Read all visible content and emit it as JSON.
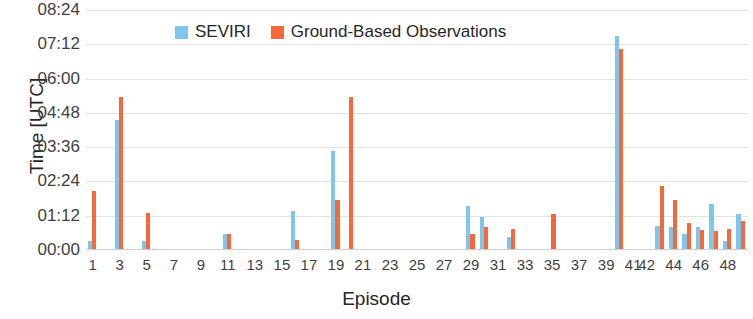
{
  "chart_data": {
    "type": "bar",
    "title": "",
    "xlabel": "Episode",
    "ylabel": "Time [UTC]",
    "grid": true,
    "legend_position": "top-center",
    "ylim": [
      0,
      8.4
    ],
    "y_tick_labels": [
      "00:00",
      "01:12",
      "02:24",
      "03:36",
      "04:48",
      "06:00",
      "07:12",
      "08:24"
    ],
    "y_tick_values": [
      0,
      1.2,
      2.4,
      3.6,
      4.8,
      6.0,
      7.2,
      8.4
    ],
    "x_tick_labels": [
      "1",
      "3",
      "5",
      "7",
      "9",
      "11",
      "13",
      "15",
      "17",
      "19",
      "21",
      "23",
      "25",
      "27",
      "29",
      "31",
      "33",
      "35",
      "37",
      "39",
      "41",
      "42",
      "44",
      "46",
      "48"
    ],
    "x_tick_indices": [
      0,
      2,
      4,
      6,
      8,
      10,
      12,
      14,
      16,
      18,
      20,
      22,
      24,
      26,
      28,
      30,
      32,
      34,
      36,
      38,
      40,
      41,
      43,
      45,
      47
    ],
    "categories": [
      "1",
      "2",
      "3",
      "4",
      "5",
      "6",
      "7",
      "8",
      "9",
      "10",
      "11",
      "12",
      "13",
      "14",
      "15",
      "16",
      "17",
      "18",
      "19",
      "20",
      "21",
      "22",
      "23",
      "24",
      "25",
      "26",
      "27",
      "28",
      "29",
      "30",
      "31",
      "32",
      "33",
      "34",
      "35",
      "36",
      "37",
      "38",
      "39",
      "40",
      "41",
      "42",
      "43",
      "44",
      "45",
      "46",
      "47",
      "48",
      "49"
    ],
    "series": [
      {
        "name": "SEVIRI",
        "color": "#7FC6EA",
        "values": [
          0.3,
          0,
          4.55,
          0,
          0.3,
          0,
          0,
          0,
          0,
          0,
          0.55,
          0,
          0,
          0,
          0,
          1.35,
          0,
          0,
          3.45,
          0,
          0,
          0,
          0,
          0,
          0,
          0,
          0,
          0,
          1.55,
          1.15,
          0,
          0.45,
          0,
          0,
          0,
          0,
          0,
          0,
          0,
          7.5,
          0,
          0,
          0.85,
          0.8,
          0.55,
          0.8,
          1.6,
          0.3,
          1.25
        ]
      },
      {
        "name": "Ground-Based Observations",
        "color": "#F4683C",
        "values": [
          2.05,
          0,
          5.35,
          0,
          1.3,
          0,
          0,
          0,
          0,
          0,
          0.55,
          0,
          0,
          0,
          0,
          0.35,
          0,
          0,
          1.75,
          5.35,
          0,
          0,
          0,
          0,
          0,
          0,
          0,
          0,
          0.55,
          0.8,
          0,
          0.75,
          0,
          0,
          1.25,
          0,
          0,
          0,
          0,
          7.05,
          0,
          0,
          2.25,
          1.75,
          0.95,
          0.7,
          0.65,
          0.75,
          1.0
        ]
      }
    ]
  },
  "legend": {
    "entries": [
      {
        "label": "SEVIRI",
        "swatch": "seviri"
      },
      {
        "label": "Ground-Based Observations",
        "swatch": "ground"
      }
    ]
  },
  "axes": {
    "y_title": "Time [UTC]",
    "x_title": "Episode"
  },
  "colors": {
    "seviri": "#7FC6EA",
    "ground": "#F4683C",
    "gridline": "#e2e2e2",
    "text": "#3f3f3f",
    "background": "#ffffff"
  }
}
